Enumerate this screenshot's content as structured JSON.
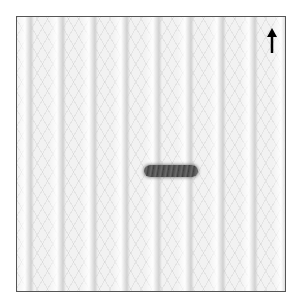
{
  "image": {
    "subject": "knitted fabric sample",
    "description": "White ribbed knit fabric with a short dark horizontal yarn mark in the center and a direction arrow pointing up in the top-right corner",
    "background_color": "#ffffff",
    "fabric_color": "#f2f2f2",
    "border_color": "#555555",
    "mark_color": "#4a4a4a"
  },
  "icons": {
    "arrow": "arrow-up-icon"
  }
}
